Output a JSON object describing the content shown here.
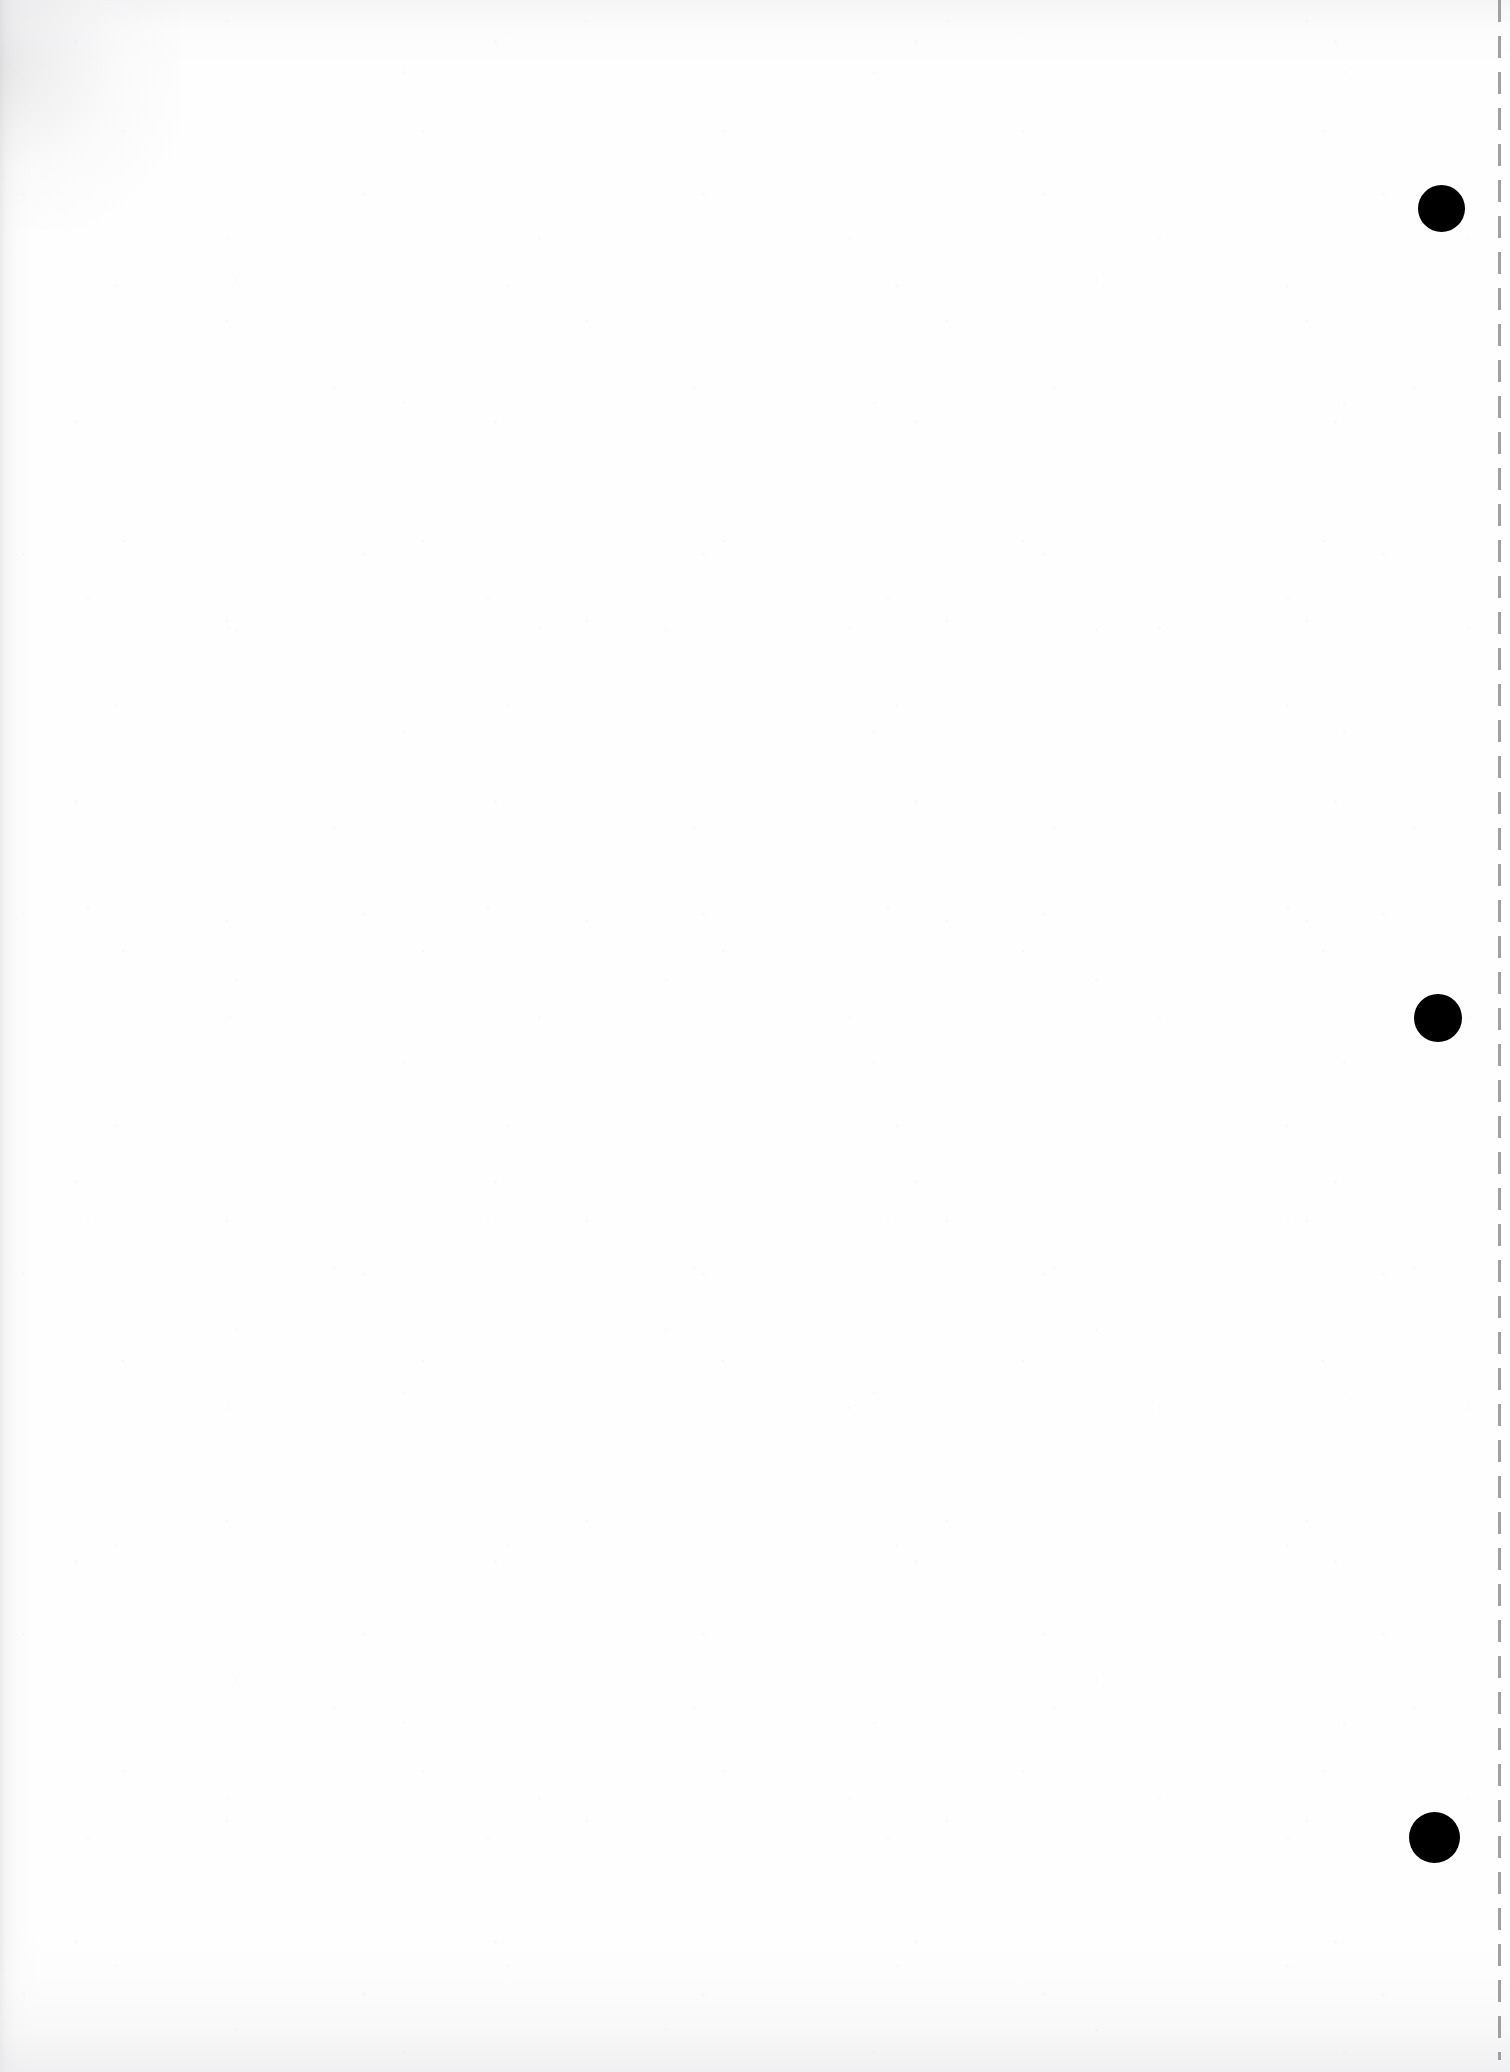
{
  "document": {
    "kind": "scanned-page",
    "page_label": "",
    "body_text": "",
    "width_px": 1510,
    "height_px": 2072,
    "background_color": "#ffffff",
    "paper_tone_color": "#fefefe",
    "ink_color": "#000000"
  },
  "marks": {
    "fiducial_dots": [
      {
        "name": "top",
        "cx": 1441,
        "cy": 208,
        "diameter": 47,
        "color": "#000000"
      },
      {
        "name": "middle",
        "cx": 1438,
        "cy": 1018,
        "diameter": 48,
        "color": "#000000"
      },
      {
        "name": "bottom",
        "cx": 1434,
        "cy": 1837,
        "diameter": 51,
        "color": "#000000"
      }
    ],
    "dashed_rule": {
      "name": "right-edge-dashed-rule",
      "x": 1498,
      "y_start": 0,
      "y_end": 2060,
      "thickness": 3,
      "dash_length": 22,
      "gap_length": 14,
      "color": "#8c8c90"
    }
  },
  "scan_artifacts": {
    "left_edge_shading_color": "#c4c4c6",
    "bottom_edge_shading_color": "#e5e5e8",
    "top_edge_shading_color": "#eaeaed",
    "speckle_color": "#aaaaaf"
  },
  "accessibility": {
    "page_description": "Blank scanned document page with three black circular registration marks down the right margin and a dashed vertical line at the right edge."
  }
}
